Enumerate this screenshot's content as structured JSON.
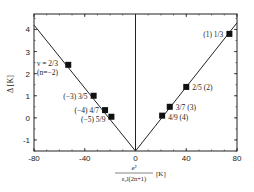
{
  "chart_data": {
    "type": "scatter",
    "title": "",
    "xlabel": "e^2 / (ε_0 l (2n+1)) [K]",
    "xlabel_parts": {
      "numerator": "e²",
      "denominator": "ε₀l(2n+1)",
      "unit": "[K]"
    },
    "ylabel": "Δ [K]",
    "xlim": [
      -80,
      80
    ],
    "ylim": [
      -1.5,
      4.7
    ],
    "x_ticks": [
      -80,
      -40,
      0,
      40,
      80
    ],
    "x_tick_labels": [
      "-80",
      "-40",
      "0",
      "40",
      "80"
    ],
    "y_ticks": [
      -1,
      0,
      1,
      2,
      3,
      4
    ],
    "y_tick_labels": [
      "-1",
      "0",
      "1",
      "2",
      "3",
      "4"
    ],
    "grid": false,
    "legend": null,
    "series": [
      {
        "name": "measured gaps",
        "marker": "square",
        "points": [
          {
            "x": -53,
            "y": 2.4,
            "label": "ν = 2/3",
            "label2": "(n=−2)"
          },
          {
            "x": -33,
            "y": 1.0,
            "label": "(−3)  3/5"
          },
          {
            "x": -24,
            "y": 0.35,
            "label": "(−4)  4/7"
          },
          {
            "x": -19,
            "y": 0.05,
            "label": "(−5)  5/9"
          },
          {
            "x": 74,
            "y": 3.8,
            "label": "(1)  1/3"
          },
          {
            "x": 40,
            "y": 1.4,
            "label": "2/5  (2)"
          },
          {
            "x": 27,
            "y": 0.5,
            "label": "3/7  (3)"
          },
          {
            "x": 21,
            "y": 0.1,
            "label": "4/9  (4)"
          }
        ]
      },
      {
        "name": "linear fit (left)",
        "type": "line",
        "points": [
          {
            "x": -80,
            "y": 4.2
          },
          {
            "x": 0,
            "y": -1.5
          }
        ]
      },
      {
        "name": "linear fit (right)",
        "type": "line",
        "points": [
          {
            "x": 0,
            "y": -1.5
          },
          {
            "x": 80,
            "y": 4.3
          }
        ]
      },
      {
        "name": "vertical line at x=0",
        "type": "line",
        "points": [
          {
            "x": 0,
            "y": -1.5
          },
          {
            "x": 0,
            "y": 4.7
          }
        ]
      }
    ]
  }
}
